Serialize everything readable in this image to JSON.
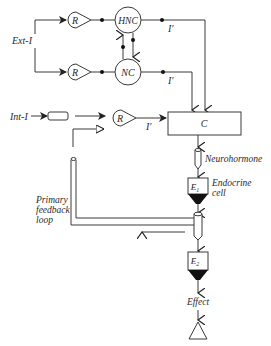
{
  "diagram": {
    "type": "neuroendocrine control flow diagram",
    "inputs": {
      "external": "Ext-I",
      "internal": "Int-I"
    },
    "nodes": {
      "receptor_top": "R",
      "receptor_bottom": "R",
      "receptor_internal": "R",
      "hnc": "HNC",
      "nc": "NC",
      "center": "C",
      "e1": "E",
      "e1_sub": "1",
      "e2": "E",
      "e2_sub": "2"
    },
    "signals": {
      "i_prime_top": "I′",
      "i_prime_bottom": "I′",
      "i_prime_internal": "I′"
    },
    "labels": {
      "neurohormone": "Neurohormone",
      "endocrine_line1": "Endocrine",
      "endocrine_line2": "cell",
      "feedback_line1": "Primary",
      "feedback_line2": "feedback",
      "feedback_line3": "loop",
      "effect": "Effect"
    },
    "colors": {
      "line": "#3a3a3a",
      "fill_dark": "#111111",
      "background": "#ffffff"
    }
  }
}
